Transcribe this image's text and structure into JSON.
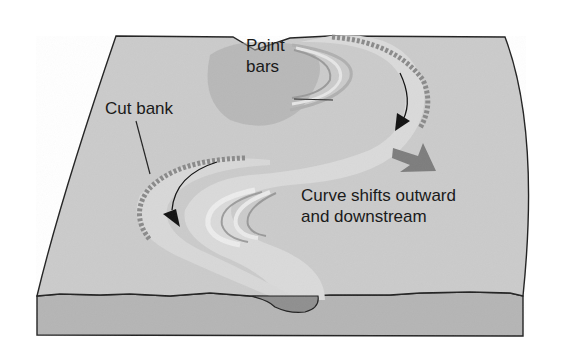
{
  "diagram": {
    "labels": {
      "cut_bank": "Cut bank",
      "point_bars_line1": "Point",
      "point_bars_line2": "bars",
      "curve_shift_line1": "Curve shifts outward",
      "curve_shift_line2": "and downstream"
    },
    "colors": {
      "surface": "#c9c9c9",
      "block_side": "#b3b3b3",
      "channel": "#d6d6d6",
      "point_bar_shadow": "#9e9e9e",
      "channel_section": "#8f8f8f",
      "migration_arrow": "#7a7a7a",
      "outline": "#222222"
    },
    "elements": [
      {
        "name": "block-surface"
      },
      {
        "name": "block-front-face"
      },
      {
        "name": "meander-channel"
      },
      {
        "name": "point-bar-upper"
      },
      {
        "name": "point-bar-lower"
      },
      {
        "name": "cut-bank-upper"
      },
      {
        "name": "cut-bank-lower"
      },
      {
        "name": "flow-arrow-upper"
      },
      {
        "name": "flow-arrow-lower"
      },
      {
        "name": "migration-arrow"
      },
      {
        "name": "channel-cross-section"
      }
    ]
  }
}
